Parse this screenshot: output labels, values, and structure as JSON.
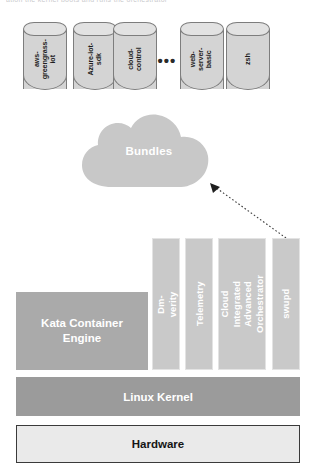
{
  "page": {
    "top_cut_text": "ation the kernel boots and runs the orchestrator"
  },
  "bundles_row": {
    "cylinders": [
      {
        "id": "aws-greengrass-iot",
        "label": "aws-\ngreengrass-\niot",
        "x": 23
      },
      {
        "id": "azure-iot-sdk",
        "label": "Azure-iot-\nsdk",
        "x": 73
      },
      {
        "id": "cloud-control",
        "label": "cloud-\ncontrol",
        "x": 113
      },
      {
        "id": "web-server-basic",
        "label": "web-\nserver-\nbasic",
        "x": 180
      },
      {
        "id": "zsh",
        "label": "zsh",
        "x": 226
      }
    ],
    "ellipsis": "•••"
  },
  "cloud": {
    "label": "Bundles",
    "fill": "#c8c8c8"
  },
  "arrow": {
    "style": "dotted",
    "direction": "swupd-to-bundles"
  },
  "vertical_bars": [
    {
      "id": "dm-verity",
      "label": "Dm-verity",
      "x": 152,
      "width": 28
    },
    {
      "id": "telemetry",
      "label": "Telemetry",
      "x": 185,
      "width": 28
    },
    {
      "id": "cloud-integrated-advanced-orchestrator",
      "label": "Cloud Integrated\nAdvanced\nOrchestrator",
      "x": 218,
      "width": 48
    },
    {
      "id": "swupd",
      "label": "swupd",
      "x": 272,
      "width": 28
    }
  ],
  "layers": {
    "kata": "Kata Container\nEngine",
    "kernel": "Linux Kernel",
    "hardware": "Hardware"
  },
  "colors": {
    "cylinder_fill": "#d4d4d4",
    "cylinder_stroke": "#7d7d7d",
    "bar_fill": "#c9c9c9",
    "kata_fill": "#aaaaaa",
    "kernel_fill": "#9b9b9b",
    "hardware_fill": "#eaeaea",
    "hardware_border": "#3a3a3a"
  }
}
